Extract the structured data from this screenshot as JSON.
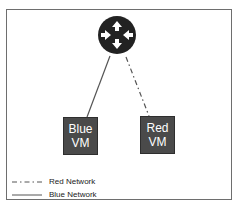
{
  "diagram": {
    "router": {
      "icon": "router-icon",
      "color": "#222222"
    },
    "nodes": [
      {
        "id": "blue-vm",
        "line1": "Blue",
        "line2": "VM",
        "fill": "#4a4a4a"
      },
      {
        "id": "red-vm",
        "line1": "Red",
        "line2": "VM",
        "fill": "#4a4a4a"
      }
    ],
    "links": [
      {
        "from": "router",
        "to": "blue-vm",
        "network": "Blue Network",
        "style": "solid"
      },
      {
        "from": "router",
        "to": "red-vm",
        "network": "Red Network",
        "style": "dash-dot"
      }
    ],
    "legend": [
      {
        "label": "Red Network",
        "style": "dash-dot"
      },
      {
        "label": "Blue Network",
        "style": "solid"
      }
    ]
  }
}
